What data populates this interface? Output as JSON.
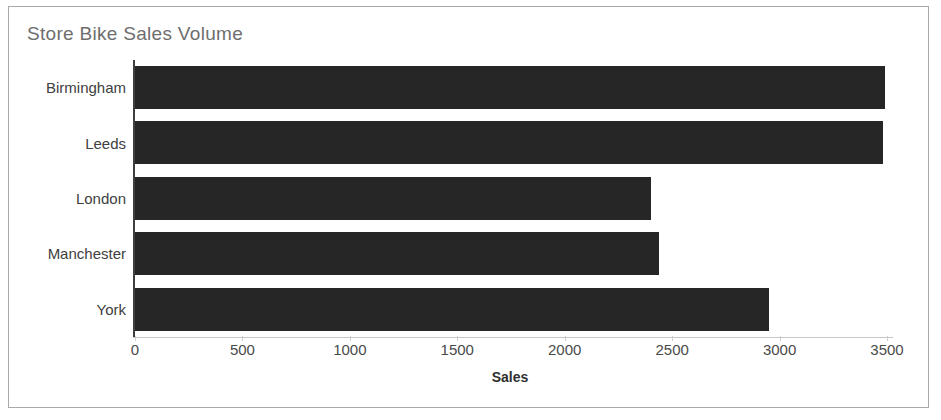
{
  "chart_data": {
    "type": "bar",
    "orientation": "horizontal",
    "title": "Store Bike Sales Volume",
    "xlabel": "Sales",
    "ylabel": "",
    "categories": [
      "Birmingham",
      "Leeds",
      "London",
      "Manchester",
      "York"
    ],
    "values": [
      3490,
      3480,
      2400,
      2440,
      2950
    ],
    "xlim": [
      0,
      3500
    ],
    "xticks": [
      0,
      500,
      1000,
      1500,
      2000,
      2500,
      3000,
      3500
    ],
    "xticklabels": [
      "0",
      "500",
      "1000",
      "1500",
      "2000",
      "2500",
      "3000",
      "3500"
    ],
    "grid": false,
    "legend": null,
    "bar_color": "#262626",
    "title_color": "#6e6e6e",
    "axis_color": "#3f3f3f",
    "frame_color": "#a9a9a9"
  }
}
